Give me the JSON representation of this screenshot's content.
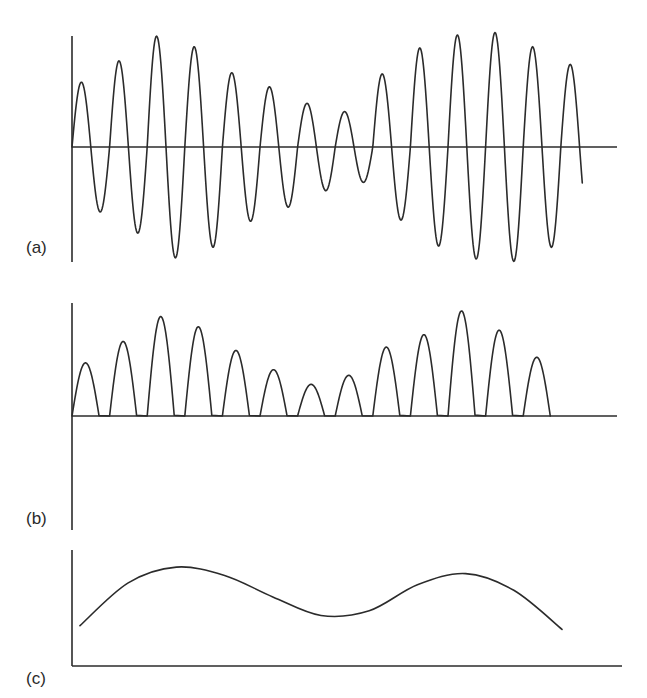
{
  "figure": {
    "panels": [
      {
        "id": "a",
        "label": "(a)"
      },
      {
        "id": "b",
        "label": "(b)"
      },
      {
        "id": "c",
        "label": "(c)"
      }
    ],
    "colors": {
      "line": "#2b2b2b",
      "background": "#ffffff"
    }
  },
  "chart_data": [
    {
      "panel": "(a)",
      "type": "line",
      "title": "",
      "description": "Amplitude-modulated carrier signal oscillating about the zero axis",
      "xlabel": "",
      "ylabel": "",
      "grid": false,
      "legend": null,
      "carrier_cycles": 13,
      "peak_amplitudes": [
        0.55,
        0.73,
        0.94,
        0.85,
        0.63,
        0.51,
        0.37,
        0.3,
        0.62,
        0.84,
        0.95,
        0.97,
        0.85
      ],
      "trough_amplitudes": [
        -0.55,
        -0.73,
        -0.94,
        -0.85,
        -0.63,
        -0.51,
        -0.37,
        -0.3,
        -0.62,
        -0.84,
        -0.95,
        -0.97,
        -0.85
      ],
      "end_value": 0.7
    },
    {
      "panel": "(b)",
      "type": "line",
      "title": "",
      "description": "Half-wave rectified version of (a): positive half-cycles only, zero elsewhere",
      "xlabel": "",
      "ylabel": "",
      "grid": false,
      "legend": null,
      "lobe_count": 13,
      "lobe_heights": [
        0.47,
        0.66,
        0.88,
        0.79,
        0.58,
        0.41,
        0.28,
        0.36,
        0.61,
        0.72,
        0.93,
        0.76,
        0.52
      ]
    },
    {
      "panel": "(c)",
      "type": "line",
      "title": "",
      "description": "Recovered low-frequency envelope (demodulated signal)",
      "xlabel": "",
      "ylabel": "",
      "grid": false,
      "legend": null,
      "x": [
        0,
        0.1,
        0.2,
        0.3,
        0.4,
        0.5,
        0.6,
        0.7,
        0.8,
        0.9,
        1.0
      ],
      "y": [
        0.24,
        0.7,
        0.87,
        0.78,
        0.55,
        0.35,
        0.4,
        0.68,
        0.8,
        0.62,
        0.2
      ]
    }
  ]
}
